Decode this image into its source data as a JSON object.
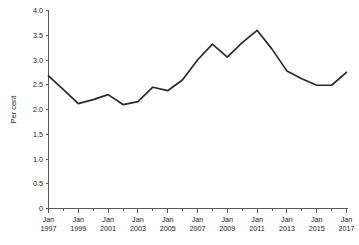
{
  "chart_data": {
    "type": "line",
    "title": "",
    "subtitle": "",
    "xlabel": "",
    "ylabel": "Per cent",
    "ylim": [
      0,
      4.0
    ],
    "yticks": [
      "0",
      "0.5",
      "1.0",
      "1.5",
      "2.0",
      "2.5",
      "3.0",
      "3.5",
      "4.0"
    ],
    "ytick_values": [
      0,
      0.5,
      1.0,
      1.5,
      2.0,
      2.5,
      3.0,
      3.5,
      4.0
    ],
    "xtick_labels": [
      "Jan\n1997",
      "Jan\n1999",
      "Jan\n2001",
      "Jan\n2003",
      "Jan\n2005",
      "Jan\n2007",
      "Jan\n2009",
      "Jan\n2011",
      "Jan\n2013",
      "Jan\n2015",
      "Jan\n2017"
    ],
    "xtick_lines": [
      [
        "Jan",
        "1997"
      ],
      [
        "Jan",
        "1999"
      ],
      [
        "Jan",
        "2001"
      ],
      [
        "Jan",
        "2003"
      ],
      [
        "Jan",
        "2005"
      ],
      [
        "Jan",
        "2007"
      ],
      [
        "Jan",
        "2009"
      ],
      [
        "Jan",
        "2011"
      ],
      [
        "Jan",
        "2013"
      ],
      [
        "Jan",
        "2015"
      ],
      [
        "Jan",
        "2017"
      ]
    ],
    "xtick_values": [
      1997,
      1999,
      2001,
      2003,
      2005,
      2007,
      2009,
      2011,
      2013,
      2015,
      2017
    ],
    "minor_xticks": [
      1998,
      2000,
      2002,
      2004,
      2006,
      2008,
      2010,
      2012,
      2014,
      2016
    ],
    "x": [
      1997,
      1998,
      1999,
      2000,
      2001,
      2002,
      2003,
      2004,
      2005,
      2006,
      2007,
      2008,
      2009,
      2010,
      2011,
      2012,
      2013,
      2014,
      2015,
      2016,
      2017
    ],
    "values": [
      2.68,
      2.4,
      2.12,
      2.2,
      2.3,
      2.1,
      2.16,
      2.45,
      2.38,
      2.6,
      3.0,
      3.32,
      3.06,
      3.35,
      3.6,
      3.22,
      2.78,
      2.62,
      2.49,
      2.49,
      2.75
    ],
    "series": [
      {
        "name": "Per cent",
        "color": "#2b2b2b",
        "values": [
          2.68,
          2.4,
          2.12,
          2.2,
          2.3,
          2.1,
          2.16,
          2.45,
          2.38,
          2.6,
          3.0,
          3.32,
          3.06,
          3.35,
          3.6,
          3.22,
          2.78,
          2.62,
          2.49,
          2.49,
          2.75
        ]
      }
    ],
    "grid": false,
    "legend": false,
    "legend_position": "none",
    "xlim": [
      1997,
      2017
    ],
    "annotations": []
  },
  "axes": {
    "y_axis_label": "Per cent",
    "x_axis_label": ""
  },
  "colors": {
    "line": "#2b2b2b",
    "axis": "#5a5a5a",
    "background": "#ffffff",
    "text": "#1a1a1a"
  }
}
